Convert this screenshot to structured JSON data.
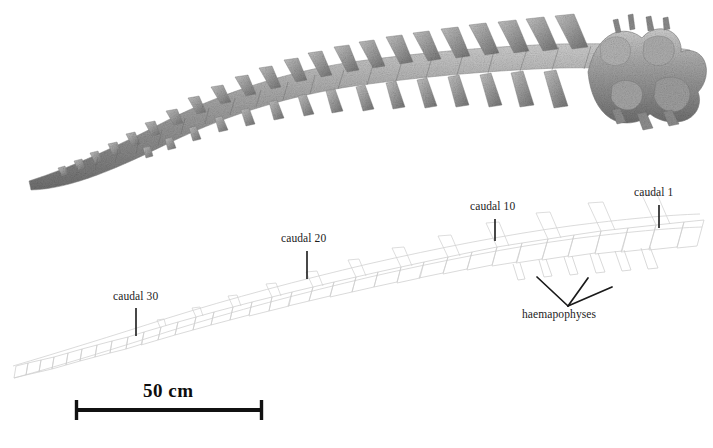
{
  "figure": {
    "kind": "scientific-figure",
    "background_color": "#ffffff",
    "ink_color": "#1a1a1a",
    "drawing_outline_color": "#c8c8c8",
    "bone_tone_light": "#d8d8d8",
    "bone_tone_mid": "#9e9e9e",
    "bone_tone_dark": "#6a6a6a"
  },
  "labels": {
    "caudal_1": "caudal 1",
    "caudal_10": "caudal 10",
    "caudal_20": "caudal 20",
    "caudal_30": "caudal 30",
    "haemapophyses": "haemapophyses"
  },
  "scale_bar": {
    "text": "50 cm",
    "value": 50,
    "unit": "cm",
    "x_start": 75,
    "x_end": 263,
    "y": 410,
    "pixel_length": 188
  },
  "leader_ticks": {
    "caudal_1": {
      "x": 659,
      "y_top": 205,
      "y_bottom": 228
    },
    "caudal_10": {
      "x": 495,
      "y_top": 219,
      "y_bottom": 241
    },
    "caudal_20": {
      "x": 307,
      "y_top": 251,
      "y_bottom": 279
    },
    "caudal_30": {
      "x": 136,
      "y_top": 308,
      "y_bottom": 336
    }
  },
  "haemapophyses_pointer": {
    "vertex_x": 568,
    "vertex_y": 306,
    "arm_left_x": 537,
    "arm_left_y": 277,
    "arm_right_x": 612,
    "arm_right_y": 287
  },
  "photograph": {
    "description": "greyscale photograph of articulated caudal vertebrae, distal tip at lower left curving up to the proximal block at upper right",
    "tip_x": 28,
    "tip_y": 180,
    "proximal_x": 700,
    "proximal_y": 55,
    "vertebra_count_visible": 36
  },
  "line_drawing": {
    "description": "faint grey outline interpretation of the same caudal series, offset below the photograph",
    "tip_x": 12,
    "tip_y": 366,
    "proximal_x": 700,
    "proximal_y": 212,
    "vertebra_count": 36
  }
}
